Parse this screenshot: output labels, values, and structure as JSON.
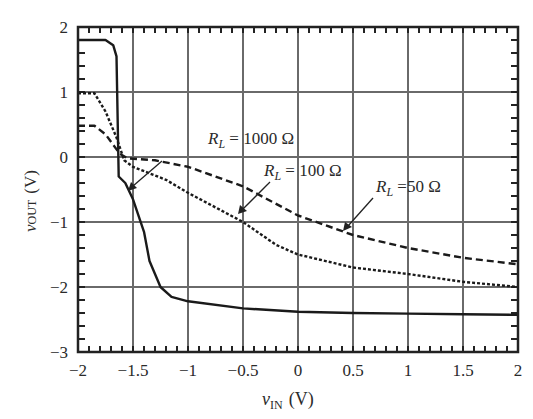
{
  "chart_data": {
    "type": "line",
    "title": "",
    "xlabel": "v_IN (V)",
    "ylabel": "v_OUT (V)",
    "xlim": [
      -2,
      2
    ],
    "ylim": [
      -3,
      2
    ],
    "grid": true,
    "x_ticks": [
      -2,
      -1.5,
      -1,
      -0.5,
      0,
      0.5,
      1,
      1.5,
      2
    ],
    "x_tick_labels": [
      "−2",
      "−1.5",
      "−1",
      "−0.5",
      "0",
      "0.5",
      "1",
      "1.5",
      "2"
    ],
    "y_ticks": [
      2,
      1,
      0,
      -1,
      -2,
      -3
    ],
    "y_tick_labels": [
      "2",
      "1",
      "0",
      "−1",
      "−2",
      "−3"
    ],
    "series": [
      {
        "name": "R_L = 1000 Ω",
        "style": "solid",
        "points": [
          [
            -2,
            1.8
          ],
          [
            -1.75,
            1.8
          ],
          [
            -1.68,
            1.72
          ],
          [
            -1.65,
            1.55
          ],
          [
            -1.63,
            -0.3
          ],
          [
            -1.57,
            -0.4
          ],
          [
            -1.5,
            -0.65
          ],
          [
            -1.4,
            -1.15
          ],
          [
            -1.35,
            -1.6
          ],
          [
            -1.25,
            -2.0
          ],
          [
            -1.15,
            -2.15
          ],
          [
            -1.0,
            -2.22
          ],
          [
            -0.5,
            -2.33
          ],
          [
            0,
            -2.38
          ],
          [
            0.5,
            -2.4
          ],
          [
            1.0,
            -2.41
          ],
          [
            1.5,
            -2.42
          ],
          [
            2.0,
            -2.43
          ]
        ]
      },
      {
        "name": "R_L = 100 Ω",
        "style": "dotted",
        "points": [
          [
            -2,
            0.98
          ],
          [
            -1.85,
            0.98
          ],
          [
            -1.75,
            0.7
          ],
          [
            -1.65,
            0.3
          ],
          [
            -1.58,
            -0.05
          ],
          [
            -1.5,
            -0.15
          ],
          [
            -1.2,
            -0.35
          ],
          [
            -1.0,
            -0.55
          ],
          [
            -0.5,
            -1.0
          ],
          [
            -0.2,
            -1.35
          ],
          [
            0,
            -1.5
          ],
          [
            0.5,
            -1.7
          ],
          [
            1.0,
            -1.8
          ],
          [
            1.5,
            -1.92
          ],
          [
            2.0,
            -2.0
          ]
        ]
      },
      {
        "name": "R_L = 50 Ω",
        "style": "dashed",
        "points": [
          [
            -2,
            0.48
          ],
          [
            -1.85,
            0.48
          ],
          [
            -1.75,
            0.35
          ],
          [
            -1.62,
            0.05
          ],
          [
            -1.55,
            -0.02
          ],
          [
            -1.3,
            -0.05
          ],
          [
            -1.0,
            -0.15
          ],
          [
            -0.5,
            -0.45
          ],
          [
            0,
            -0.9
          ],
          [
            0.5,
            -1.2
          ],
          [
            1.0,
            -1.4
          ],
          [
            1.5,
            -1.55
          ],
          [
            2.0,
            -1.65
          ]
        ]
      }
    ],
    "annotations": [
      {
        "text": "R_L = 1000 Ω",
        "arrow_to": [
          -1.5,
          -0.45
        ]
      },
      {
        "text": "R_L = 100 Ω",
        "arrow_to": [
          -0.55,
          -0.9
        ]
      },
      {
        "text": "R_L =50 Ω",
        "arrow_to": [
          0.4,
          -1.2
        ]
      }
    ]
  },
  "labels": {
    "xlabel_var": "v",
    "xlabel_sub": "IN",
    "xlabel_unit": "(V)",
    "ylabel_var": "v",
    "ylabel_sub": "OUT",
    "ylabel_unit": "(V)",
    "ann1_main": "R",
    "ann1_sub": "L",
    "ann1_rest": " = 1000 Ω",
    "ann2_main": "R",
    "ann2_sub": "L",
    "ann2_rest": " = 100 Ω",
    "ann3_main": "R",
    "ann3_sub": "L",
    "ann3_rest": " =50 Ω"
  }
}
